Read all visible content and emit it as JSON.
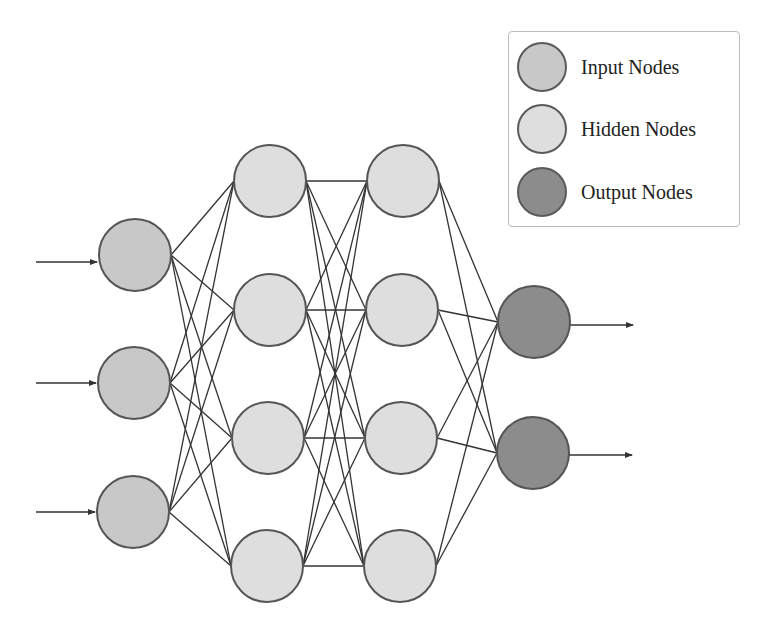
{
  "diagram": {
    "colors": {
      "input": "#c8c8c8",
      "hidden": "#dedede",
      "output": "#8c8c8c",
      "stroke": "#555555",
      "edge": "#333333"
    },
    "node_radius": 36,
    "layers": [
      {
        "name": "input",
        "type": "input",
        "nodes": [
          [
            135,
            255
          ],
          [
            134,
            383
          ],
          [
            133,
            512
          ]
        ]
      },
      {
        "name": "hidden-1",
        "type": "hidden",
        "nodes": [
          [
            270,
            181
          ],
          [
            270,
            310
          ],
          [
            268,
            438
          ],
          [
            267,
            566
          ]
        ]
      },
      {
        "name": "hidden-2",
        "type": "hidden",
        "nodes": [
          [
            403,
            181
          ],
          [
            402,
            310
          ],
          [
            401,
            438
          ],
          [
            400,
            566
          ]
        ]
      },
      {
        "name": "output",
        "type": "output",
        "nodes": [
          [
            534,
            322
          ],
          [
            533,
            453
          ]
        ]
      }
    ],
    "input_arrows": [
      [
        36,
        262,
        97,
        262
      ],
      [
        36,
        383,
        96,
        383
      ],
      [
        36,
        512,
        95,
        512
      ]
    ],
    "output_arrows": [
      [
        570,
        325,
        633,
        325
      ],
      [
        569,
        455,
        632,
        455
      ]
    ]
  },
  "legend": {
    "items": [
      {
        "label": "Input Nodes",
        "type": "input"
      },
      {
        "label": "Hidden Nodes",
        "type": "hidden"
      },
      {
        "label": "Output Nodes",
        "type": "output"
      }
    ]
  }
}
